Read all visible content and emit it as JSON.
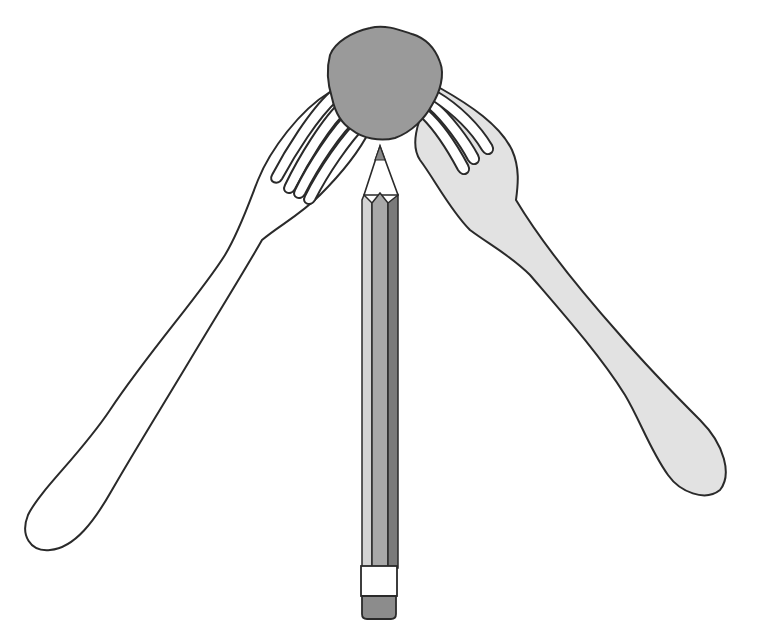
{
  "illustration": {
    "description": "Two forks balanced on a pencil tip with a lump of clay joining them",
    "colors": {
      "background": "#ffffff",
      "outline": "#2a2a2a",
      "clay": "#9a9a9a",
      "left_fork_fill": "#ffffff",
      "right_fork_fill": "#e2e2e2",
      "pencil_light": "#d4d4d4",
      "pencil_mid": "#a8a8a8",
      "pencil_dark": "#7a7a7a",
      "pencil_wood": "#ffffff",
      "pencil_lead": "#8a8a8a",
      "ferrule": "#ffffff",
      "eraser": "#8c8c8c"
    },
    "objects": [
      "clay-ball",
      "left-fork",
      "right-fork",
      "pencil"
    ]
  }
}
